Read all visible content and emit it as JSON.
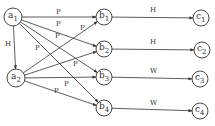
{
  "diagram": {
    "type": "directed-graph",
    "colors": {
      "stroke": "#333333",
      "background": "#ffffff"
    },
    "nodes": [
      {
        "id": "a1",
        "base": "a",
        "sub": "1",
        "x": 13,
        "y": 17,
        "r": 9
      },
      {
        "id": "a2",
        "base": "a",
        "sub": "2",
        "x": 16,
        "y": 78,
        "r": 9
      },
      {
        "id": "b1",
        "base": "b",
        "sub": "1",
        "x": 104,
        "y": 17,
        "r": 8
      },
      {
        "id": "b2",
        "base": "b",
        "sub": "2",
        "x": 104,
        "y": 49,
        "r": 8
      },
      {
        "id": "b3",
        "base": "b",
        "sub": "3",
        "x": 104,
        "y": 77,
        "r": 8
      },
      {
        "id": "b4",
        "base": "b",
        "sub": "4",
        "x": 104,
        "y": 108,
        "r": 8
      },
      {
        "id": "c1",
        "base": "c",
        "sub": "1",
        "x": 201,
        "y": 18,
        "r": 8
      },
      {
        "id": "c2",
        "base": "c",
        "sub": "2",
        "x": 202,
        "y": 50,
        "r": 8
      },
      {
        "id": "c3",
        "base": "c",
        "sub": "3",
        "x": 200,
        "y": 79,
        "r": 8
      },
      {
        "id": "c4",
        "base": "c",
        "sub": "4",
        "x": 200,
        "y": 111,
        "r": 8
      }
    ],
    "edges": [
      {
        "from": "a1",
        "to": "a2",
        "label": "H",
        "lx": 5,
        "ly": 46
      },
      {
        "from": "a1",
        "to": "b1",
        "label": "P",
        "lx": 56,
        "ly": 14
      },
      {
        "from": "a1",
        "to": "b2",
        "label": "P",
        "lx": 56,
        "ly": 26
      },
      {
        "from": "a1",
        "to": "b3",
        "label": "P",
        "lx": 55,
        "ly": 38
      },
      {
        "from": "a1",
        "to": "b4",
        "label": "P",
        "lx": 35,
        "ly": 50
      },
      {
        "from": "a2",
        "to": "b1",
        "label": "P",
        "lx": 80,
        "ly": 30
      },
      {
        "from": "a2",
        "to": "b2",
        "label": "P",
        "lx": 73,
        "ly": 66
      },
      {
        "from": "a2",
        "to": "b3",
        "label": "P",
        "lx": 64,
        "ly": 86
      },
      {
        "from": "a2",
        "to": "b4",
        "label": "P",
        "lx": 54,
        "ly": 93
      },
      {
        "from": "b1",
        "to": "c1",
        "label": "H",
        "lx": 150,
        "ly": 12
      },
      {
        "from": "b2",
        "to": "c2",
        "label": "H",
        "lx": 150,
        "ly": 44
      },
      {
        "from": "b3",
        "to": "c3",
        "label": "W",
        "lx": 150,
        "ly": 73
      },
      {
        "from": "b4",
        "to": "c4",
        "label": "W",
        "lx": 150,
        "ly": 105
      }
    ]
  }
}
